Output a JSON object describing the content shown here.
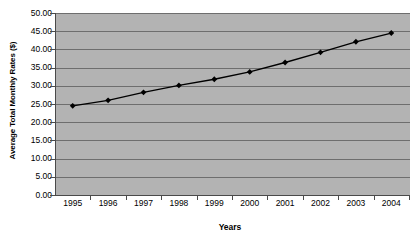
{
  "chart_data": {
    "type": "line",
    "title": "",
    "xlabel": "Years",
    "ylabel": "Average Total Monthly Rates ($)",
    "categories": [
      "1995",
      "1996",
      "1997",
      "1998",
      "1999",
      "2000",
      "2001",
      "2002",
      "2003",
      "2004"
    ],
    "values": [
      24.5,
      26.0,
      28.2,
      30.1,
      31.8,
      33.8,
      36.4,
      39.2,
      42.1,
      44.5
    ],
    "series": [
      {
        "name": "Average Total Monthly Rates ($)",
        "values": [
          24.5,
          26.0,
          28.2,
          30.1,
          31.8,
          33.8,
          36.4,
          39.2,
          42.1,
          44.5
        ]
      }
    ],
    "ylim": [
      0.0,
      50.0
    ],
    "ytick_labels": [
      "0.00",
      "5.00",
      "10.00",
      "15.00",
      "20.00",
      "25.00",
      "30.00",
      "35.00",
      "40.00",
      "45.00",
      "50.00"
    ],
    "ytick_values": [
      0,
      5,
      10,
      15,
      20,
      25,
      30,
      35,
      40,
      45,
      50
    ],
    "grid": true,
    "legend": false,
    "legend_position": "none",
    "marker": "diamond",
    "line_color": "#000000",
    "marker_color": "#000000",
    "plot_background": "#b3b3b3",
    "gridline_color": "#6e6e6e"
  }
}
